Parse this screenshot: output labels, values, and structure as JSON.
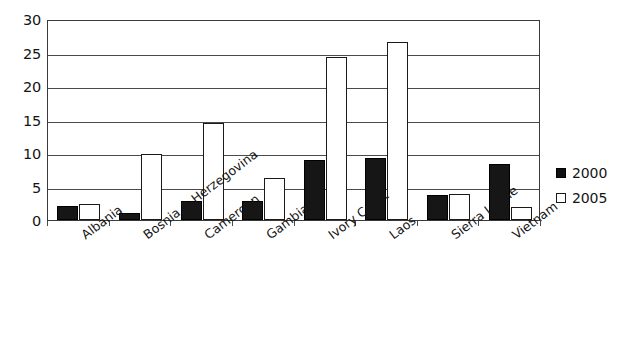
{
  "chart_data": {
    "type": "bar",
    "title": "",
    "subtitle": "",
    "xlabel": "",
    "ylabel": "",
    "ylim": [
      0,
      30
    ],
    "yticks": [
      0,
      5,
      10,
      15,
      20,
      25,
      30
    ],
    "ytick_labels": [
      "0",
      "5",
      "10",
      "15",
      "20",
      "25",
      "30"
    ],
    "grid": true,
    "legend_position": "right",
    "categories": [
      "Albania",
      "Bosnia & Herzegovina",
      "Cameroon",
      "Gambia",
      "Ivory Coast",
      "Laos",
      "Sierra Leone",
      "Vietnam"
    ],
    "series": [
      {
        "name": "2000",
        "color": "#101010",
        "values": [
          2.1,
          1.0,
          2.8,
          2.8,
          9.0,
          9.2,
          3.7,
          8.4
        ]
      },
      {
        "name": "2005",
        "color": "#ffffff",
        "values": [
          2.4,
          9.8,
          14.5,
          6.3,
          24.3,
          26.5,
          3.9,
          1.9
        ]
      }
    ]
  },
  "legend": {
    "items": [
      {
        "label": "2000",
        "style": "filled"
      },
      {
        "label": "2005",
        "style": "outlined"
      }
    ]
  }
}
